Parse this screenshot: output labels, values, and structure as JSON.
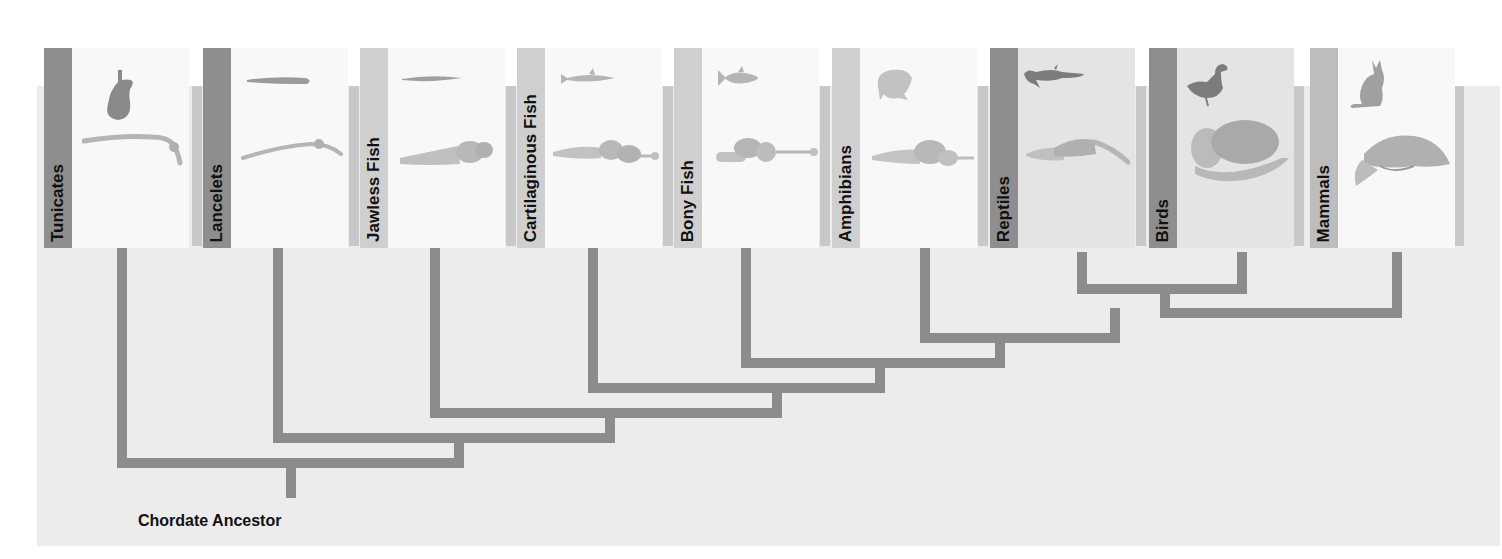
{
  "diagram": {
    "type": "cladogram",
    "root_label": "Chordate Ancestor",
    "colors": {
      "branch": "#8c8c8c",
      "panel_bg": "#ececec",
      "card_bg_light": "#f8f8f8",
      "card_bg_shaded": "#e4e4e4",
      "label_bar_dark": "#8e8e8e",
      "label_bar_light": "#cfcfcf"
    },
    "taxa": [
      {
        "name": "Tunicates",
        "animal_icon": "tunicate-silhouette",
        "brain_icon": "simple-nerve-cord"
      },
      {
        "name": "Lancelets",
        "animal_icon": "lancelet-silhouette",
        "brain_icon": "simple-nerve-cord"
      },
      {
        "name": "Jawless Fish",
        "animal_icon": "lamprey-silhouette",
        "brain_icon": "fish-brain"
      },
      {
        "name": "Cartilaginous Fish",
        "animal_icon": "shark-silhouette",
        "brain_icon": "fish-brain"
      },
      {
        "name": "Bony Fish",
        "animal_icon": "fish-silhouette",
        "brain_icon": "fish-brain"
      },
      {
        "name": "Amphibians",
        "animal_icon": "frog-silhouette",
        "brain_icon": "amphibian-brain"
      },
      {
        "name": "Reptiles",
        "animal_icon": "crocodile-silhouette",
        "brain_icon": "reptile-brain"
      },
      {
        "name": "Birds",
        "animal_icon": "duck-silhouette",
        "brain_icon": "bird-brain"
      },
      {
        "name": "Mammals",
        "animal_icon": "cat-silhouette",
        "brain_icon": "mammal-brain"
      }
    ],
    "clades": [
      [
        "Reptiles",
        "Birds"
      ],
      [
        [
          "Reptiles",
          "Birds"
        ],
        "Mammals"
      ],
      [
        "Amphibians",
        [
          [
            "Reptiles",
            "Birds"
          ],
          "Mammals"
        ]
      ],
      [
        "Bony Fish",
        "..."
      ],
      [
        "Cartilaginous Fish",
        "..."
      ],
      [
        "Jawless Fish",
        "..."
      ],
      [
        "Lancelets",
        "..."
      ],
      [
        "Tunicates",
        "..."
      ]
    ]
  }
}
